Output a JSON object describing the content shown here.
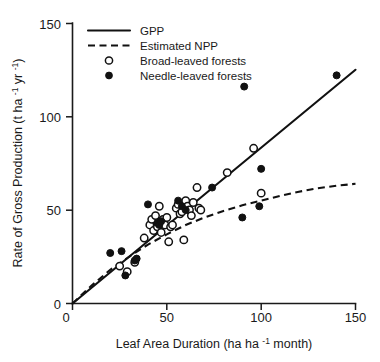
{
  "chart_data": {
    "type": "scatter",
    "title": "",
    "xlabel": "Leaf Area Duration (ha ha -1 month)",
    "xlabel_parts": {
      "main": "Leaf Area Duration (ha ha ",
      "sup": "-1",
      "tail": " month)"
    },
    "ylabel": "Rate of Gross Production (t ha -1 yr -1)",
    "ylabel_parts": {
      "main": "Rate of Gross Production (t ha ",
      "sup1": "-1",
      "mid": " yr ",
      "sup2": "-1",
      "tail": ")"
    },
    "xlim": [
      0,
      150
    ],
    "ylim": [
      0,
      150
    ],
    "xticks": [
      0,
      50,
      100,
      150
    ],
    "yticks": [
      0,
      50,
      100,
      150
    ],
    "xticklabels": [
      "0",
      "50",
      "100",
      "150"
    ],
    "yticklabels": [
      "0",
      "50",
      "100",
      "150"
    ],
    "grid": false,
    "legend_position": "top-left",
    "legend": [
      {
        "label": "GPP",
        "marker": "solid-line"
      },
      {
        "label": "Estimated NPP",
        "marker": "dashed-line"
      },
      {
        "label": "Broad-leaved forests",
        "marker": "open-circle"
      },
      {
        "label": "Needle-leaved forests",
        "marker": "filled-circle"
      }
    ],
    "series": [
      {
        "name": "GPP",
        "type": "line",
        "style": "solid",
        "points": [
          [
            0,
            0
          ],
          [
            150,
            125
          ]
        ]
      },
      {
        "name": "Estimated NPP",
        "type": "line",
        "style": "dashed",
        "points": [
          [
            0,
            0
          ],
          [
            10,
            9.5
          ],
          [
            20,
            18
          ],
          [
            30,
            25
          ],
          [
            40,
            31.5
          ],
          [
            50,
            37
          ],
          [
            60,
            42
          ],
          [
            70,
            46
          ],
          [
            80,
            49.5
          ],
          [
            90,
            52.5
          ],
          [
            100,
            55
          ],
          [
            110,
            57.5
          ],
          [
            120,
            59.8
          ],
          [
            130,
            61.6
          ],
          [
            140,
            63
          ],
          [
            150,
            64
          ]
        ]
      },
      {
        "name": "Broad-leaved forests",
        "type": "scatter",
        "marker": "open-circle",
        "points": [
          [
            25,
            20
          ],
          [
            29,
            17
          ],
          [
            33,
            22
          ],
          [
            38,
            35
          ],
          [
            41,
            42
          ],
          [
            42,
            45
          ],
          [
            43,
            39
          ],
          [
            44,
            47
          ],
          [
            45,
            41
          ],
          [
            46,
            52
          ],
          [
            47,
            44
          ],
          [
            47,
            38
          ],
          [
            48,
            45
          ],
          [
            49,
            42
          ],
          [
            50,
            46
          ],
          [
            51,
            33
          ],
          [
            52,
            41
          ],
          [
            53,
            42
          ],
          [
            55,
            51
          ],
          [
            56,
            53
          ],
          [
            57,
            48
          ],
          [
            58,
            49
          ],
          [
            59,
            34
          ],
          [
            60,
            55
          ],
          [
            61,
            52
          ],
          [
            62,
            50
          ],
          [
            63,
            47
          ],
          [
            64,
            54
          ],
          [
            66,
            62
          ],
          [
            67,
            51
          ],
          [
            68,
            50
          ],
          [
            82,
            70
          ],
          [
            96,
            83
          ],
          [
            100,
            59
          ]
        ]
      },
      {
        "name": "Needle-leaved forests",
        "type": "scatter",
        "marker": "filled-circle",
        "points": [
          [
            20,
            27
          ],
          [
            26,
            28
          ],
          [
            28,
            15
          ],
          [
            33,
            23
          ],
          [
            34,
            24
          ],
          [
            40,
            53
          ],
          [
            45,
            43
          ],
          [
            46,
            42
          ],
          [
            47,
            44
          ],
          [
            56,
            55
          ],
          [
            58,
            52
          ],
          [
            60,
            50
          ],
          [
            74,
            62
          ],
          [
            90,
            46
          ],
          [
            91,
            116
          ],
          [
            99,
            52
          ],
          [
            100,
            72
          ],
          [
            140,
            122
          ]
        ]
      }
    ]
  }
}
